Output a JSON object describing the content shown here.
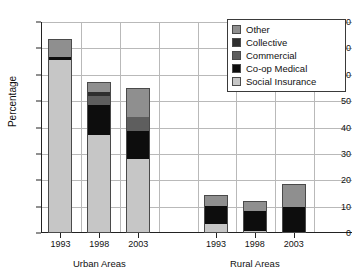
{
  "chart_data": {
    "type": "bar",
    "subtype": "stacked",
    "title": "",
    "xlabel": "",
    "ylabel": "Percentage",
    "ylim": [
      0,
      80
    ],
    "yticks": [
      0,
      10,
      20,
      30,
      40,
      50,
      60,
      70,
      80
    ],
    "grid": true,
    "legend_position": "top-right",
    "groups": [
      "Urban Areas",
      "Rural Areas"
    ],
    "categories": [
      "1993",
      "1998",
      "2003",
      "1993",
      "1998",
      "2003"
    ],
    "series": [
      {
        "name": "Social Insurance",
        "color": "#c6c6c6",
        "values": [
          65.5,
          37.0,
          28.0,
          3.5,
          0.6,
          0.5
        ]
      },
      {
        "name": "Co-op Medical",
        "color": "#0d0d0d",
        "values": [
          1.3,
          11.5,
          10.7,
          6.6,
          7.9,
          9.2
        ]
      },
      {
        "name": "Commercial",
        "color": "#5e5e5e",
        "values": [
          0.0,
          3.5,
          5.3,
          0.0,
          0.0,
          0.0
        ]
      },
      {
        "name": "Collective",
        "color": "#2e2e2e",
        "values": [
          0.0,
          1.3,
          0.0,
          0.0,
          0.0,
          0.0
        ]
      },
      {
        "name": "Other",
        "color": "#8f8f8f",
        "values": [
          6.7,
          4.0,
          11.0,
          4.4,
          3.5,
          8.8
        ]
      }
    ],
    "totals": [
      73.5,
      57.3,
      55.0,
      14.5,
      12.0,
      18.5
    ]
  },
  "legend": {
    "items": [
      {
        "label": "Other",
        "color": "#8f8f8f"
      },
      {
        "label": "Collective",
        "color": "#2e2e2e"
      },
      {
        "label": "Commercial",
        "color": "#5e5e5e"
      },
      {
        "label": "Co-op Medical",
        "color": "#0d0d0d"
      },
      {
        "label": "Social Insurance",
        "color": "#c6c6c6"
      }
    ]
  }
}
